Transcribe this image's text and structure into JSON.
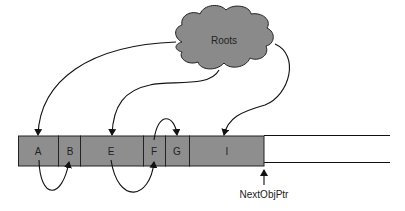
{
  "diagram": {
    "type": "heap-allocation-with-roots",
    "colors": {
      "cloud_fill": "#8a8a8a",
      "cell_fill": "#8e8e8e",
      "stroke": "#111111",
      "background": "#ffffff"
    },
    "roots": {
      "label": "Roots"
    },
    "heap": {
      "cells": [
        {
          "id": "A",
          "label": "A"
        },
        {
          "id": "B",
          "label": "B"
        },
        {
          "id": "E",
          "label": "E"
        },
        {
          "id": "F",
          "label": "F"
        },
        {
          "id": "G",
          "label": "G"
        },
        {
          "id": "I",
          "label": "I"
        }
      ],
      "pointer": {
        "label": "NextObjPtr"
      }
    },
    "edges": [
      {
        "from": "Roots",
        "to": "A"
      },
      {
        "from": "Roots",
        "to": "E"
      },
      {
        "from": "Roots",
        "to": "I"
      },
      {
        "from": "A",
        "to": "B"
      },
      {
        "from": "E",
        "to": "F"
      },
      {
        "from": "F",
        "to": "G"
      }
    ]
  }
}
